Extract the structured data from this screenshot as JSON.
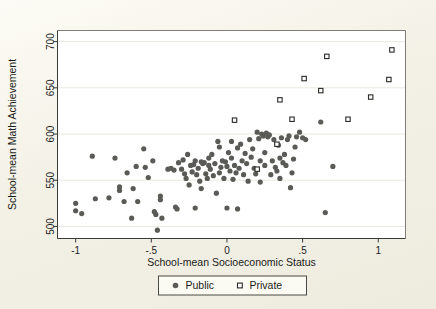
{
  "figure": {
    "background_color": "#f3f1e6",
    "plot_background_color": "#ffffff"
  },
  "chart_data": {
    "type": "scatter",
    "title": "",
    "xlabel": "School-mean Socioeconomic Status",
    "ylabel": "School-mean Math Achievement",
    "xlim": [
      -1.12,
      1.18
    ],
    "ylim": [
      487,
      712
    ],
    "xticks": [
      -1,
      -0.5,
      0,
      0.5,
      1
    ],
    "xticklabels": [
      "-1",
      "-.5",
      "0",
      ".5",
      "1"
    ],
    "yticks": [
      500,
      550,
      600,
      650,
      700
    ],
    "yticklabels": [
      "500",
      "550",
      "600",
      "650",
      "700"
    ],
    "grid": "horizontal",
    "legend_position": "below-axis",
    "series": [
      {
        "name": "Public",
        "marker": "filled-circle",
        "color": "#5a5a57",
        "points": [
          [
            -1.0,
            525
          ],
          [
            -1.0,
            517
          ],
          [
            -0.96,
            514
          ],
          [
            -0.89,
            576
          ],
          [
            -0.87,
            530
          ],
          [
            -0.78,
            531
          ],
          [
            -0.74,
            574
          ],
          [
            -0.71,
            543
          ],
          [
            -0.71,
            539
          ],
          [
            -0.68,
            527
          ],
          [
            -0.66,
            558
          ],
          [
            -0.63,
            509
          ],
          [
            -0.62,
            541
          ],
          [
            -0.6,
            565
          ],
          [
            -0.59,
            527
          ],
          [
            -0.55,
            584
          ],
          [
            -0.54,
            564
          ],
          [
            -0.52,
            553
          ],
          [
            -0.49,
            571
          ],
          [
            -0.48,
            516
          ],
          [
            -0.47,
            513
          ],
          [
            -0.46,
            496
          ],
          [
            -0.44,
            533
          ],
          [
            -0.44,
            529
          ],
          [
            -0.43,
            509
          ],
          [
            -0.39,
            562
          ],
          [
            -0.37,
            563
          ],
          [
            -0.35,
            561
          ],
          [
            -0.34,
            521
          ],
          [
            -0.33,
            519
          ],
          [
            -0.32,
            569
          ],
          [
            -0.3,
            562
          ],
          [
            -0.29,
            572
          ],
          [
            -0.28,
            557
          ],
          [
            -0.27,
            552
          ],
          [
            -0.26,
            578
          ],
          [
            -0.25,
            545
          ],
          [
            -0.24,
            566
          ],
          [
            -0.23,
            559
          ],
          [
            -0.22,
            567
          ],
          [
            -0.21,
            520
          ],
          [
            -0.21,
            571
          ],
          [
            -0.2,
            556
          ],
          [
            -0.19,
            563
          ],
          [
            -0.18,
            549
          ],
          [
            -0.17,
            570
          ],
          [
            -0.17,
            541
          ],
          [
            -0.16,
            568
          ],
          [
            -0.15,
            569
          ],
          [
            -0.14,
            557
          ],
          [
            -0.13,
            552
          ],
          [
            -0.12,
            566
          ],
          [
            -0.12,
            574
          ],
          [
            -0.11,
            562
          ],
          [
            -0.1,
            578
          ],
          [
            -0.09,
            555
          ],
          [
            -0.08,
            568
          ],
          [
            -0.07,
            536
          ],
          [
            -0.06,
            592
          ],
          [
            -0.05,
            586
          ],
          [
            -0.05,
            558
          ],
          [
            -0.04,
            564
          ],
          [
            -0.03,
            571
          ],
          [
            -0.02,
            552
          ],
          [
            -0.01,
            570
          ],
          [
            0.0,
            565
          ],
          [
            0.0,
            520
          ],
          [
            0.01,
            580
          ],
          [
            0.02,
            560
          ],
          [
            0.03,
            592
          ],
          [
            0.03,
            574
          ],
          [
            0.04,
            551
          ],
          [
            0.05,
            566
          ],
          [
            0.06,
            558
          ],
          [
            0.07,
            585
          ],
          [
            0.07,
            519
          ],
          [
            0.08,
            563
          ],
          [
            0.09,
            589
          ],
          [
            0.1,
            571
          ],
          [
            0.11,
            556
          ],
          [
            0.12,
            579
          ],
          [
            0.13,
            568
          ],
          [
            0.14,
            549
          ],
          [
            0.15,
            594
          ],
          [
            0.16,
            575
          ],
          [
            0.17,
            584
          ],
          [
            0.18,
            563
          ],
          [
            0.19,
            557
          ],
          [
            0.2,
            602
          ],
          [
            0.21,
            595
          ],
          [
            0.22,
            571
          ],
          [
            0.22,
            548
          ],
          [
            0.23,
            600
          ],
          [
            0.24,
            598
          ],
          [
            0.25,
            580
          ],
          [
            0.25,
            566
          ],
          [
            0.26,
            601
          ],
          [
            0.27,
            597
          ],
          [
            0.28,
            599
          ],
          [
            0.29,
            556
          ],
          [
            0.3,
            571
          ],
          [
            0.31,
            594
          ],
          [
            0.32,
            564
          ],
          [
            0.33,
            560
          ],
          [
            0.34,
            588
          ],
          [
            0.35,
            574
          ],
          [
            0.35,
            552
          ],
          [
            0.36,
            596
          ],
          [
            0.37,
            569
          ],
          [
            0.38,
            578
          ],
          [
            0.39,
            566
          ],
          [
            0.4,
            594
          ],
          [
            0.41,
            598
          ],
          [
            0.42,
            542
          ],
          [
            0.43,
            558
          ],
          [
            0.44,
            573
          ],
          [
            0.45,
            586
          ],
          [
            0.46,
            597
          ],
          [
            0.48,
            602
          ],
          [
            0.5,
            596
          ],
          [
            0.52,
            594
          ],
          [
            0.62,
            613
          ],
          [
            0.65,
            515
          ],
          [
            0.7,
            565
          ]
        ]
      },
      {
        "name": "Private",
        "marker": "open-square",
        "color": "#2a2a27",
        "points": [
          [
            0.05,
            615
          ],
          [
            0.2,
            562
          ],
          [
            0.33,
            589
          ],
          [
            0.35,
            637
          ],
          [
            0.43,
            616
          ],
          [
            0.51,
            660
          ],
          [
            0.62,
            647
          ],
          [
            0.66,
            684
          ],
          [
            0.8,
            616
          ],
          [
            0.95,
            640
          ],
          [
            1.07,
            659
          ],
          [
            1.09,
            691
          ]
        ]
      }
    ],
    "legend_entries": [
      {
        "label": "Public",
        "marker": "filled-circle"
      },
      {
        "label": "Private",
        "marker": "open-square"
      }
    ]
  }
}
